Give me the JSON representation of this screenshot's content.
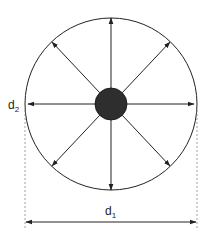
{
  "diagram": {
    "title": "",
    "labels": {
      "d1": {
        "base": "d",
        "sub": "1"
      },
      "d2": {
        "base": "d",
        "sub": "2"
      }
    },
    "geometry": {
      "center": [
        111,
        104
      ],
      "outer_radius": 86,
      "inner_radius": 16,
      "arrow_count": 8,
      "d1_line_y": 222
    },
    "colors": {
      "stroke": "#222222",
      "core_fill": "#2e2e2e",
      "dashed": "#888888"
    }
  }
}
